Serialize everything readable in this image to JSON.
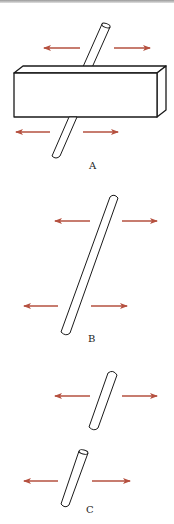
{
  "colors": {
    "arrow": "#b5503f",
    "outline": "#1a1a1a",
    "background": "#ffffff"
  },
  "panels": [
    {
      "id": "A",
      "label": "A",
      "description": "Rod passing through a rectangular block, with pulling arrows above and below the block"
    },
    {
      "id": "B",
      "label": "B",
      "description": "Single long rod with pulling arrows at top and bottom"
    },
    {
      "id": "C",
      "label": "C",
      "description": "Rod broken into two pieces, each with pulling arrows"
    }
  ]
}
